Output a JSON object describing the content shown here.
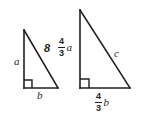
{
  "figure": {
    "stroke_color": "#231f20",
    "text_color": "#231f20",
    "background_color": "#ffffff",
    "left_triangle": {
      "name": "small-right-triangle",
      "vertices": {
        "apex": [
          24,
          30
        ],
        "right_angle": [
          24,
          88
        ],
        "base_right": [
          58,
          88
        ]
      },
      "labels": {
        "vertical_leg": "a",
        "hypotenuse": "8",
        "horizontal_leg": "b"
      }
    },
    "right_triangle": {
      "name": "large-right-triangle",
      "vertices": {
        "apex": [
          80,
          10
        ],
        "right_angle": [
          80,
          88
        ],
        "base_right": [
          130,
          88
        ]
      },
      "labels": {
        "vertical_leg_numerator": "4",
        "vertical_leg_denominator": "3",
        "vertical_leg_variable": "a",
        "hypotenuse": "c",
        "horizontal_leg_numerator": "4",
        "horizontal_leg_denominator": "3",
        "horizontal_leg_variable": "b"
      }
    }
  }
}
